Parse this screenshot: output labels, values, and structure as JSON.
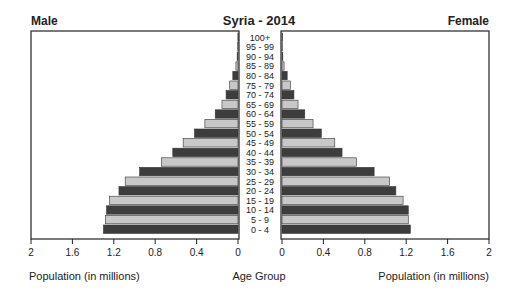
{
  "chart_data": {
    "type": "bar",
    "subtype": "population-pyramid",
    "title": "Syria - 2014",
    "left_label": "Male",
    "right_label": "Female",
    "center_axis_label": "Age Group",
    "xlabel_left": "Population (in millions)",
    "xlabel_right": "Population (in millions)",
    "xlim": [
      0,
      2
    ],
    "xticks": [
      "0",
      "0.4",
      "0.8",
      "1.2",
      "1.6",
      "2"
    ],
    "xtick_values": [
      0,
      0.4,
      0.8,
      1.2,
      1.6,
      2
    ],
    "categories": [
      "100+",
      "95 - 99",
      "90 - 94",
      "85 - 89",
      "80 - 84",
      "75 - 79",
      "70 - 74",
      "65 - 69",
      "60 - 64",
      "55 - 59",
      "50 - 54",
      "45 - 49",
      "40 - 44",
      "35 - 39",
      "30 - 34",
      "25 - 29",
      "20 - 24",
      "15 - 19",
      "10 - 14",
      "5 - 9",
      "0 - 4"
    ],
    "series": [
      {
        "name": "Male",
        "values": [
          0.001,
          0.003,
          0.008,
          0.02,
          0.05,
          0.08,
          0.115,
          0.155,
          0.22,
          0.32,
          0.42,
          0.53,
          0.63,
          0.74,
          0.95,
          1.09,
          1.15,
          1.24,
          1.27,
          1.28,
          1.3
        ]
      },
      {
        "name": "Female",
        "values": [
          0.001,
          0.003,
          0.008,
          0.02,
          0.05,
          0.08,
          0.115,
          0.155,
          0.22,
          0.3,
          0.38,
          0.51,
          0.58,
          0.72,
          0.89,
          1.04,
          1.1,
          1.17,
          1.22,
          1.22,
          1.24
        ]
      }
    ],
    "colors": {
      "dark": "#3d3d3d",
      "light": "#c8c8c8",
      "frame": "#222222"
    },
    "grid": false
  }
}
